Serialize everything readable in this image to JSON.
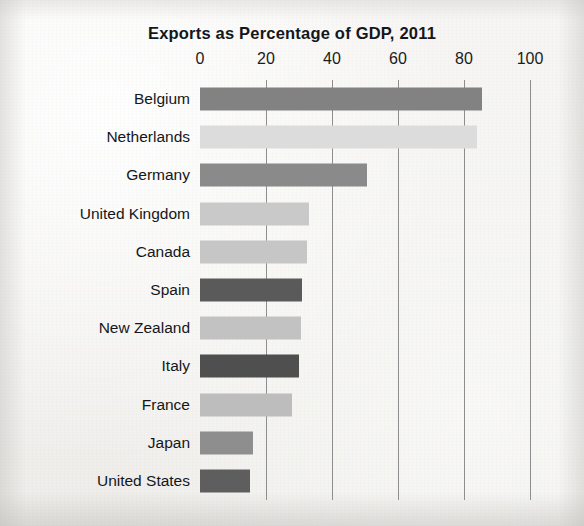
{
  "chart_data": {
    "type": "bar",
    "orientation": "horizontal",
    "title": "Exports as Percentage of GDP, 2011",
    "xlabel": "",
    "ylabel": "",
    "xlim": [
      0,
      100
    ],
    "xticks": [
      0,
      20,
      40,
      60,
      80,
      100
    ],
    "xtick_labels": [
      "0",
      "20",
      "40",
      "60",
      "80",
      "100"
    ],
    "grid": "vertical",
    "legend": "none",
    "categories": [
      "Belgium",
      "Netherlands",
      "Germany",
      "United Kingdom",
      "Canada",
      "Spain",
      "New Zealand",
      "Italy",
      "France",
      "Japan",
      "United States"
    ],
    "values": [
      85.5,
      84,
      50.5,
      33,
      32.5,
      31,
      30.5,
      30,
      28,
      16,
      15
    ],
    "bar_colors": [
      "#828282",
      "#dcdcdc",
      "#8a8a8a",
      "#c9c9c9",
      "#c6c6c6",
      "#5a5a5a",
      "#c2c2c2",
      "#4f4f4f",
      "#bdbdbd",
      "#8e8e8e",
      "#5e5e5e"
    ],
    "bars": [
      {
        "label": "Belgium",
        "value": 85.5,
        "color": "#828282"
      },
      {
        "label": "Netherlands",
        "value": 84,
        "color": "#dcdcdc"
      },
      {
        "label": "Germany",
        "value": 50.5,
        "color": "#8a8a8a"
      },
      {
        "label": "United Kingdom",
        "value": 33,
        "color": "#c9c9c9"
      },
      {
        "label": "Canada",
        "value": 32.5,
        "color": "#c6c6c6"
      },
      {
        "label": "Spain",
        "value": 31,
        "color": "#5a5a5a"
      },
      {
        "label": "New Zealand",
        "value": 30.5,
        "color": "#c2c2c2"
      },
      {
        "label": "Italy",
        "value": 30,
        "color": "#4f4f4f"
      },
      {
        "label": "France",
        "value": 28,
        "color": "#bdbdbd"
      },
      {
        "label": "Japan",
        "value": 16,
        "color": "#8e8e8e"
      },
      {
        "label": "United States",
        "value": 15,
        "color": "#5e5e5e"
      }
    ],
    "gridline_color": "#8d8d8d",
    "background_color": "#f4f3f1",
    "text_color": "#15161a"
  }
}
